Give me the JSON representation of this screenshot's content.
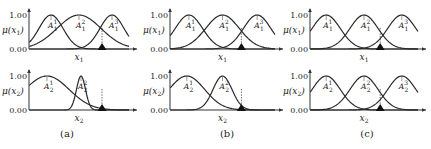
{
  "chart_data": [
    {
      "type": "line",
      "panel": "(a)",
      "subplots": [
        {
          "ylabel": "μ(x1)",
          "xlabel": "x1",
          "yticks": [
            "0.00",
            "1.00"
          ],
          "ylim": [
            0,
            1
          ],
          "x_range": [
            0,
            1
          ],
          "series": [
            {
              "name": "A1^1",
              "center": 0.22,
              "sigma": 0.12
            },
            {
              "name": "A1^2",
              "center": 0.5,
              "sigma": 0.22
            },
            {
              "name": "A1^3",
              "center": 0.83,
              "sigma": 0.12
            }
          ],
          "marker_x": 0.73
        },
        {
          "ylabel": "μ(x2)",
          "xlabel": "x2",
          "yticks": [
            "0.00",
            "1.00"
          ],
          "ylim": [
            0,
            1
          ],
          "x_range": [
            0,
            1
          ],
          "series": [
            {
              "name": "A2^1",
              "center": 0.18,
              "sigma": 0.22
            },
            {
              "name": "A2^2",
              "center": 0.52,
              "sigma": 0.045
            }
          ],
          "marker_x": 0.73
        }
      ]
    },
    {
      "type": "line",
      "panel": "(b)",
      "subplots": [
        {
          "ylabel": "μ(x1)",
          "xlabel": "x1",
          "yticks": [
            "0.00",
            "1.00"
          ],
          "ylim": [
            0,
            1
          ],
          "x_range": [
            0,
            1
          ],
          "series": [
            {
              "name": "A1^1",
              "center": 0.18,
              "sigma": 0.13
            },
            {
              "name": "A1^2",
              "center": 0.5,
              "sigma": 0.16
            },
            {
              "name": "A1^3",
              "center": 0.83,
              "sigma": 0.13
            }
          ],
          "marker_x": 0.68
        },
        {
          "ylabel": "μ(x2)",
          "xlabel": "x2",
          "yticks": [
            "0.00",
            "1.00"
          ],
          "ylim": [
            0,
            1
          ],
          "x_range": [
            0,
            1
          ],
          "series": [
            {
              "name": "A2^1",
              "center": 0.16,
              "sigma": 0.17
            },
            {
              "name": "A2^2",
              "center": 0.5,
              "sigma": 0.09
            }
          ],
          "marker_x": 0.68
        }
      ]
    },
    {
      "type": "line",
      "panel": "(c)",
      "subplots": [
        {
          "ylabel": "μ(x1)",
          "xlabel": "x1",
          "yticks": [
            "0.00",
            "1.00"
          ],
          "ylim": [
            0,
            1
          ],
          "x_range": [
            0,
            1
          ],
          "series": [
            {
              "name": "A1^1",
              "center": 0.15,
              "sigma": 0.13
            },
            {
              "name": "A1^2",
              "center": 0.5,
              "sigma": 0.13
            },
            {
              "name": "A1^3",
              "center": 0.85,
              "sigma": 0.13
            }
          ],
          "marker_x": 0.65
        },
        {
          "ylabel": "μ(x2)",
          "xlabel": "x2",
          "yticks": [
            "0.00",
            "1.00"
          ],
          "ylim": [
            0,
            1
          ],
          "x_range": [
            0,
            1
          ],
          "series": [
            {
              "name": "A2^1",
              "center": 0.15,
              "sigma": 0.13
            },
            {
              "name": "A2^2",
              "center": 0.5,
              "sigma": 0.13
            },
            {
              "name": "A2^3",
              "center": 0.85,
              "sigma": 0.13
            }
          ],
          "marker_x": 0.65
        }
      ]
    }
  ],
  "labels": {
    "tick_top": "1.00",
    "tick_bottom": "0.00",
    "mu": "μ(",
    "x": "x",
    "A": "A",
    "close": ")",
    "captions": [
      "(a)",
      "(b)",
      "(c)"
    ]
  }
}
